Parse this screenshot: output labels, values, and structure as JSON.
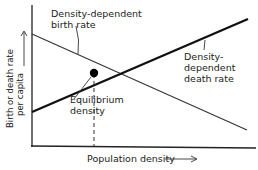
{
  "diagram": {
    "title": "",
    "axes": {
      "y_label_line1": "Birth or death rate",
      "y_label_line2": "per capita",
      "x_label": "Population density"
    },
    "lines": [
      {
        "id": "birth",
        "label_line1": "Density-dependent",
        "label_line2": "birth rate",
        "trend": "decreasing",
        "color": "#333333",
        "weight": "thin"
      },
      {
        "id": "death",
        "label_line1": "Density-",
        "label_line2": "dependent",
        "label_line3": "death rate",
        "trend": "increasing",
        "color": "#111111",
        "weight": "thick"
      }
    ],
    "equilibrium": {
      "label_line1": "Equilibrium",
      "label_line2": "density",
      "marker_color": "#000000"
    },
    "colors": {
      "background": "#ffffff",
      "ink": "#222222"
    }
  }
}
